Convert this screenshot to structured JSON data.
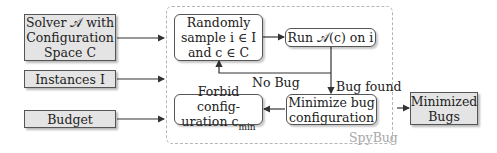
{
  "inputs": {
    "solver": {
      "line1": "Solver 𝒜 with",
      "line2": "Configuration",
      "line3": "Space C"
    },
    "instances": {
      "label": "Instances I"
    },
    "budget": {
      "label": "Budget"
    }
  },
  "container": {
    "label": "SpyBug"
  },
  "process": {
    "sample": {
      "line1": "Randomly",
      "line2": "sample i ∈ I",
      "line3": "and c ∈ C"
    },
    "run": {
      "label": "Run 𝒜(c) on i"
    },
    "minimize": {
      "line1": "Minimize bug",
      "line2": "configuration"
    },
    "forbid": {
      "line1": "Forbid config-",
      "line2": "uration c",
      "line2_sub": "min"
    }
  },
  "edges": {
    "no_bug": "No Bug",
    "bug_found": "Bug found"
  },
  "output": {
    "line1": "Minimized",
    "line2": "Bugs"
  },
  "colors": {
    "input_fill": "#e4e4e4",
    "border": "#555555",
    "dashed": "#b5b5b5",
    "container_label": "#a8a8a8"
  }
}
